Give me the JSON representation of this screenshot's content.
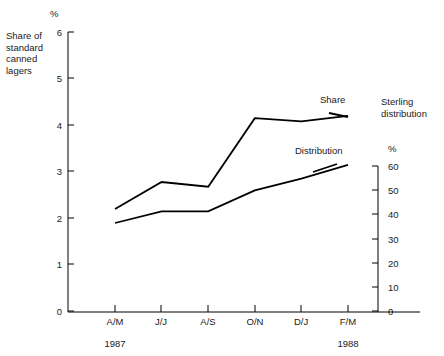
{
  "chart_data": {
    "type": "line",
    "title": "",
    "categories": [
      "A/M",
      "J/J",
      "A/S",
      "O/N",
      "D/J",
      "F/M"
    ],
    "series": [
      {
        "name": "Share",
        "axis": "left",
        "values": [
          2.2,
          2.78,
          2.68,
          4.15,
          4.08,
          4.2
        ]
      },
      {
        "name": "Distribution",
        "axis": "right",
        "values": [
          38,
          43,
          43,
          52,
          57,
          63
        ]
      }
    ],
    "left_axis": {
      "label": "Share of\nstandard\ncanned\nlagers",
      "unit": "%",
      "ticks": [
        0,
        1,
        2,
        3,
        4,
        5,
        6
      ],
      "range": [
        0,
        6
      ]
    },
    "right_axis": {
      "label": "Sterling\ndistribution",
      "unit": "%",
      "ticks": [
        0,
        10,
        20,
        30,
        40,
        50,
        60
      ],
      "range": [
        0,
        60
      ]
    },
    "x_axis": {
      "ticks": [
        "A/M",
        "J/J",
        "A/S",
        "O/N",
        "D/J",
        "F/M"
      ],
      "period_labels": [
        {
          "text": "1987",
          "at": "A/M"
        },
        {
          "text": "1988",
          "at": "F/M"
        }
      ]
    },
    "annotations": [
      {
        "text": "Share",
        "series": "Share"
      },
      {
        "text": "Distribution",
        "series": "Distribution"
      }
    ],
    "grid": false,
    "legend_position": "inline-annotations",
    "line_color": "#000000"
  }
}
